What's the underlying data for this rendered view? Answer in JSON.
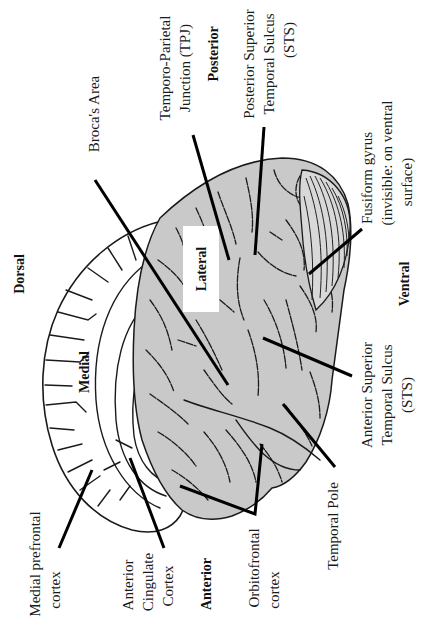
{
  "figure": {
    "orientation": "rotated-90-ccw",
    "colors": {
      "background": "#ffffff",
      "lateral_surface": "#c9c9c9",
      "medial_surface": "#ffffff",
      "outline": "#1a1a1a",
      "leader_lines": "#000000"
    }
  },
  "directions": {
    "dorsal": "Dorsal",
    "ventral": "Ventral",
    "anterior": "Anterior",
    "posterior": "Posterior"
  },
  "views": {
    "medial": "Medial",
    "lateral": "Lateral"
  },
  "regions": {
    "brocas_area": {
      "label": "Broca's Area"
    },
    "tpj": {
      "line1": "Temporo-Parietal",
      "line2": "Junction (TPJ)"
    },
    "psts": {
      "line1": "Posterior Superior",
      "line2": "Temporal Sulcus",
      "line3": "(STS)"
    },
    "fusiform": {
      "line1": "Fusiform gyrus",
      "line2": "(invisible: on ventral",
      "line3": "surface)"
    },
    "asts": {
      "line1": "Anterior Superior",
      "line2": "Temporal Sulcus",
      "line3": "(STS)"
    },
    "temporal_pole": {
      "label": "Temporal Pole"
    },
    "orbitofrontal": {
      "line1": "Orbitofrontal",
      "line2": "cortex"
    },
    "acc": {
      "line1": "Anterior",
      "line2": "Cingulate",
      "line3": "Cortex"
    },
    "mpfc": {
      "line1": "Medial prefrontal",
      "line2": "cortex"
    }
  }
}
